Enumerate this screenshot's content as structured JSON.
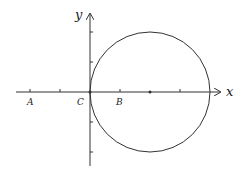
{
  "diagram": {
    "type": "coordinate-plane-with-circle",
    "axes": {
      "x_label": "x",
      "y_label": "y"
    },
    "points": [
      {
        "label": "A",
        "x": -2,
        "y": 0
      },
      {
        "label": "C",
        "x": 0,
        "y": 0
      },
      {
        "label": "B",
        "x": 1,
        "y": 0
      }
    ],
    "circle": {
      "center": [
        2,
        0
      ],
      "radius": 2,
      "center_marked": true
    },
    "x_ticks": [
      -2,
      -1,
      1,
      2,
      3
    ],
    "y_ticks": [
      -2,
      -1,
      1,
      2
    ],
    "colors": {
      "stroke": "#333333",
      "background": "#ffffff"
    }
  }
}
